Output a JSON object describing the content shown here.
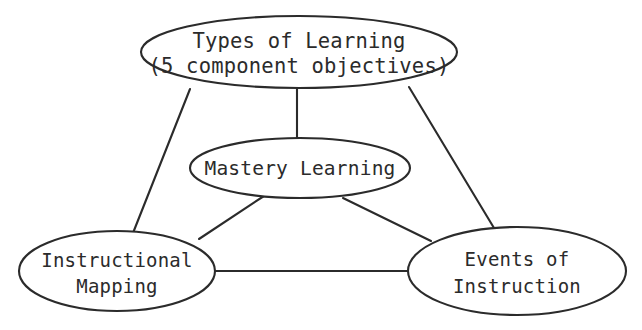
{
  "diagram": {
    "type": "concept-map",
    "background_color": "#ffffff",
    "stroke_color": "#2b2b2b",
    "nodes": [
      {
        "id": "types-of-learning",
        "shape": "ellipse",
        "cx": 299,
        "cy": 52,
        "rx": 158,
        "ry": 36,
        "lines": [
          "Types of Learning",
          "(5 component objectives)"
        ],
        "line1": "Types of Learning",
        "line2": "(5 component objectives)"
      },
      {
        "id": "mastery-learning",
        "shape": "ellipse",
        "cx": 300,
        "cy": 168,
        "rx": 110,
        "ry": 30,
        "lines": [
          "Mastery Learning"
        ],
        "line1": "Mastery Learning",
        "line2": ""
      },
      {
        "id": "instructional-mapping",
        "shape": "ellipse",
        "cx": 117,
        "cy": 271,
        "rx": 98,
        "ry": 40,
        "lines": [
          "Instructional",
          "Mapping"
        ],
        "line1": "Instructional",
        "line2": "Mapping"
      },
      {
        "id": "events-of-instruction",
        "shape": "ellipse",
        "cx": 517,
        "cy": 271,
        "rx": 109,
        "ry": 44,
        "lines": [
          "Events of",
          "Instruction"
        ],
        "line1": "Events of",
        "line2": "Instruction"
      }
    ],
    "edges": [
      {
        "id": "edge-types-to-mapping",
        "from": "types-of-learning",
        "to": "instructional-mapping",
        "x1": 190,
        "y1": 89,
        "x2": 133,
        "y2": 233
      },
      {
        "id": "edge-types-to-mastery",
        "from": "types-of-learning",
        "to": "mastery-learning",
        "x1": 297,
        "y1": 89,
        "x2": 297,
        "y2": 140
      },
      {
        "id": "edge-types-to-events",
        "from": "types-of-learning",
        "to": "events-of-instruction",
        "x1": 409,
        "y1": 87,
        "x2": 494,
        "y2": 228
      },
      {
        "id": "edge-mastery-to-mapping",
        "from": "mastery-learning",
        "to": "instructional-mapping",
        "x1": 264,
        "y1": 196,
        "x2": 199,
        "y2": 239
      },
      {
        "id": "edge-mastery-to-events",
        "from": "mastery-learning",
        "to": "events-of-instruction",
        "x1": 343,
        "y1": 198,
        "x2": 431,
        "y2": 241
      },
      {
        "id": "edge-mapping-to-events",
        "from": "instructional-mapping",
        "to": "events-of-instruction",
        "x1": 215,
        "y1": 271,
        "x2": 409,
        "y2": 271
      }
    ]
  }
}
